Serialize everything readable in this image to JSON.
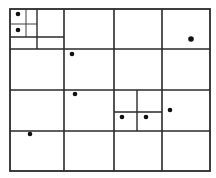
{
  "diagram": {
    "type": "quadtree-partition",
    "background": "#ffffff",
    "line_color": "#2a2a2a",
    "point_color": "#111111",
    "bounds": {
      "x1": 10,
      "y1": 9,
      "x2": 210,
      "y2": 171
    },
    "lines": [
      {
        "x1": 10,
        "y1": 49,
        "x2": 210,
        "y2": 49,
        "w": 1.6
      },
      {
        "x1": 10,
        "y1": 90,
        "x2": 210,
        "y2": 90,
        "w": 1.6
      },
      {
        "x1": 10,
        "y1": 131,
        "x2": 210,
        "y2": 131,
        "w": 1.6
      },
      {
        "x1": 64,
        "y1": 9,
        "x2": 64,
        "y2": 171,
        "w": 1.6
      },
      {
        "x1": 114,
        "y1": 9,
        "x2": 114,
        "y2": 171,
        "w": 1.6
      },
      {
        "x1": 162,
        "y1": 9,
        "x2": 162,
        "y2": 171,
        "w": 1.6
      },
      {
        "x1": 37,
        "y1": 9,
        "x2": 37,
        "y2": 49,
        "w": 1.4
      },
      {
        "x1": 10,
        "y1": 37,
        "x2": 64,
        "y2": 37,
        "w": 1.4
      },
      {
        "x1": 26,
        "y1": 9,
        "x2": 26,
        "y2": 37,
        "w": 0.9
      },
      {
        "x1": 10,
        "y1": 24,
        "x2": 37,
        "y2": 24,
        "w": 0.9
      },
      {
        "x1": 137,
        "y1": 90,
        "x2": 137,
        "y2": 131,
        "w": 1.4
      },
      {
        "x1": 114,
        "y1": 112,
        "x2": 162,
        "y2": 112,
        "w": 1.4
      }
    ],
    "points": [
      {
        "x": 18,
        "y": 14,
        "r": 2.3
      },
      {
        "x": 18,
        "y": 30,
        "r": 2.3
      },
      {
        "x": 191,
        "y": 39,
        "r": 2.8
      },
      {
        "x": 72,
        "y": 54,
        "r": 2.3
      },
      {
        "x": 75,
        "y": 94,
        "r": 2.3
      },
      {
        "x": 122,
        "y": 117,
        "r": 2.3
      },
      {
        "x": 146,
        "y": 117,
        "r": 2.3
      },
      {
        "x": 170,
        "y": 110,
        "r": 2.3
      },
      {
        "x": 30,
        "y": 134,
        "r": 2.3
      }
    ]
  }
}
